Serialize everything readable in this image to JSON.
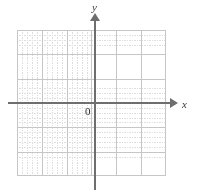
{
  "figure": {
    "kind": "blank-coordinate-grid",
    "background_color": "#ffffff",
    "width": 198,
    "height": 192
  },
  "axes": {
    "x": {
      "label": "x",
      "color": "#6e6e6e",
      "arrow_direction": "right",
      "arrow_name": "x-axis-arrow"
    },
    "y": {
      "label": "y",
      "color": "#6e6e6e",
      "arrow_direction": "up",
      "arrow_name": "y-axis-arrow"
    },
    "origin": {
      "label": "0",
      "color": "#2a2a2a"
    }
  },
  "grid": {
    "major_line_color": "#c6c6c6",
    "minor_line_color": "#dedede",
    "minor_style": "dotted",
    "major_columns": 6,
    "major_rows": 6,
    "minor_per_major": 5
  },
  "chart_data": {
    "type": "scatter",
    "title": "",
    "subtitle": "",
    "xlabel": "x",
    "ylabel": "y",
    "series": [
      {
        "name": "",
        "x": [],
        "y": []
      }
    ],
    "x": [],
    "values": [],
    "categories": [],
    "xlim": [
      -3,
      3
    ],
    "ylim": [
      -3,
      3
    ],
    "xticks": [],
    "yticks": [],
    "xticklabels": [],
    "yticklabels": [],
    "annotations": [
      {
        "text": "0",
        "x": 0,
        "y": 0
      }
    ],
    "grid": true,
    "legend": null,
    "legend_position": "none",
    "note": "Empty coordinate plane: grid and axes only, no plotted data."
  }
}
